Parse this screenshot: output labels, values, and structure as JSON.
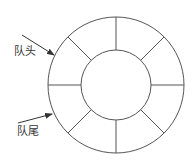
{
  "diagram": {
    "type": "circular-queue",
    "colors": {
      "stroke": "#555555",
      "text": "#333333",
      "background": "#ffffff"
    },
    "ring": {
      "cx": 116,
      "cy": 85,
      "outer_r": 68,
      "inner_r": 35,
      "segments": 8
    },
    "labels": {
      "head": "队头",
      "tail": "队尾"
    },
    "arrows": [
      {
        "name": "head-pointer",
        "from": [
          22,
          35
        ],
        "to": [
          54,
          55
        ]
      },
      {
        "name": "tail-pointer",
        "from": [
          18,
          123
        ],
        "to": [
          52,
          114
        ]
      }
    ]
  }
}
